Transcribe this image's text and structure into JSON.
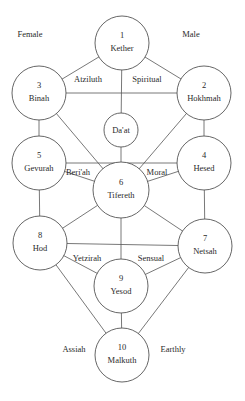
{
  "diagram": {
    "nodes": [
      {
        "id": "kether",
        "number": "1",
        "name": "Kether",
        "cx": 122,
        "cy": 43,
        "r": 27
      },
      {
        "id": "hokhmah",
        "number": "2",
        "name": "Hokhmah",
        "cx": 204,
        "cy": 93,
        "r": 27
      },
      {
        "id": "binah",
        "number": "3",
        "name": "Binah",
        "cx": 39,
        "cy": 93,
        "r": 27
      },
      {
        "id": "daat",
        "number": "",
        "name": "Da'at",
        "cx": 121,
        "cy": 130,
        "r": 17
      },
      {
        "id": "hesed",
        "number": "4",
        "name": "Hesed",
        "cx": 204,
        "cy": 163,
        "r": 27
      },
      {
        "id": "gevurah",
        "number": "5",
        "name": "Gevurah",
        "cx": 39,
        "cy": 163,
        "r": 27
      },
      {
        "id": "tifereth",
        "number": "6",
        "name": "Tifereth",
        "cx": 121,
        "cy": 190,
        "r": 28
      },
      {
        "id": "netsah",
        "number": "7",
        "name": "Netsah",
        "cx": 205,
        "cy": 246,
        "r": 27
      },
      {
        "id": "hod",
        "number": "8",
        "name": "Hod",
        "cx": 40,
        "cy": 243,
        "r": 27
      },
      {
        "id": "yesod",
        "number": "9",
        "name": "Yesod",
        "cx": 121,
        "cy": 286,
        "r": 27
      },
      {
        "id": "malkuth",
        "number": "10",
        "name": "Malkuth",
        "cx": 122,
        "cy": 355,
        "r": 27
      }
    ],
    "edges": [
      [
        "kether",
        "binah"
      ],
      [
        "kether",
        "hokhmah"
      ],
      [
        "kether",
        "daat"
      ],
      [
        "binah",
        "hokhmah"
      ],
      [
        "binah",
        "gevurah"
      ],
      [
        "hokhmah",
        "hesed"
      ],
      [
        "binah",
        "tifereth"
      ],
      [
        "hokhmah",
        "tifereth"
      ],
      [
        "daat",
        "tifereth"
      ],
      [
        "gevurah",
        "hesed"
      ],
      [
        "gevurah",
        "tifereth"
      ],
      [
        "hesed",
        "tifereth"
      ],
      [
        "gevurah",
        "hod"
      ],
      [
        "hesed",
        "netsah"
      ],
      [
        "tifereth",
        "hod"
      ],
      [
        "tifereth",
        "netsah"
      ],
      [
        "tifereth",
        "yesod"
      ],
      [
        "hod",
        "netsah"
      ],
      [
        "hod",
        "yesod"
      ],
      [
        "netsah",
        "yesod"
      ],
      [
        "hod",
        "malkuth"
      ],
      [
        "netsah",
        "malkuth"
      ],
      [
        "yesod",
        "malkuth"
      ]
    ],
    "labels": [
      {
        "id": "female",
        "text": "Female",
        "x": 30,
        "y": 37
      },
      {
        "id": "male",
        "text": "Male",
        "x": 191,
        "y": 37
      },
      {
        "id": "atziluth",
        "text": "Atziluth",
        "x": 88,
        "y": 82
      },
      {
        "id": "spiritual",
        "text": "Spiritual",
        "x": 147,
        "y": 82
      },
      {
        "id": "beriah",
        "text": "Beri'ah",
        "x": 78,
        "y": 175
      },
      {
        "id": "moral",
        "text": "Moral",
        "x": 157,
        "y": 175
      },
      {
        "id": "yetzirah",
        "text": "Yetzirah",
        "x": 87,
        "y": 261
      },
      {
        "id": "sensual",
        "text": "Sensual",
        "x": 151,
        "y": 261
      },
      {
        "id": "assiah",
        "text": "Assiah",
        "x": 74,
        "y": 352
      },
      {
        "id": "earthly",
        "text": "Earthly",
        "x": 173,
        "y": 352
      }
    ],
    "colors": {
      "background": "#ffffff",
      "stroke": "#555555",
      "text": "#2a2a2a"
    }
  }
}
